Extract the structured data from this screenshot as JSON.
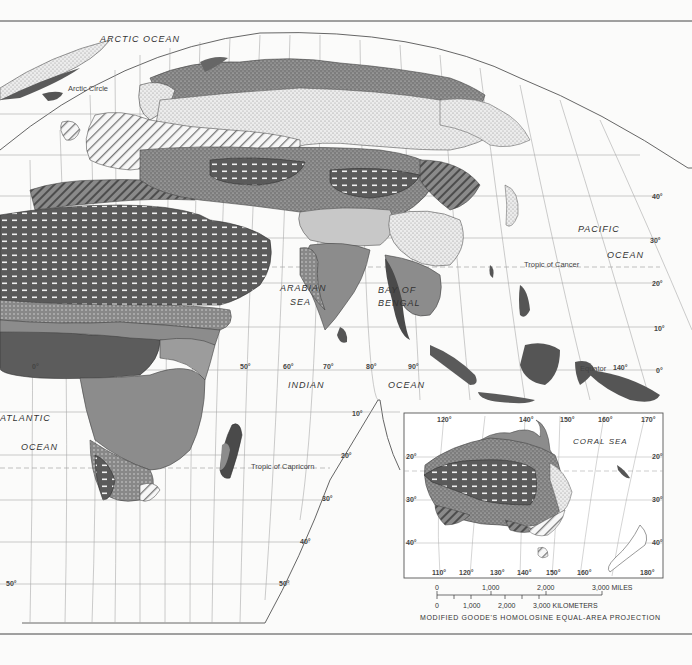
{
  "map": {
    "projection": "MODIFIED GOODE'S HOMOLOSINE EQUAL-AREA PROJECTION",
    "bodies_of_water": {
      "arctic": "ARCTIC OCEAN",
      "pacific_1": "PACIFIC",
      "pacific_2": "OCEAN",
      "arabian_1": "ARABIAN",
      "arabian_2": "SEA",
      "bengal_1": "BAY OF",
      "bengal_2": "BENGAL",
      "indian_1": "INDIAN",
      "indian_2": "OCEAN",
      "atlantic_1": "ATLANTIC",
      "atlantic_2": "OCEAN",
      "coral": "CORAL SEA"
    },
    "lines": {
      "arctic_circle": "Arctic Circle",
      "tropic_cancer": "Tropic of Cancer",
      "tropic_capricorn": "Tropic of Capricorn",
      "equator": "Equator"
    },
    "latitudes": {
      "n40": "40°",
      "n30": "30°",
      "n20": "20°",
      "n10": "10°",
      "eq": "0°",
      "s10": "10°",
      "s20": "20°",
      "s30": "30°",
      "s40": "40°",
      "s50a": "50°",
      "s50b": "50°"
    },
    "longitudes": {
      "l0": "0°",
      "l50": "50°",
      "l60": "60°",
      "l70": "70°",
      "l80": "80°",
      "l90": "90°",
      "l140": "140°"
    },
    "inset": {
      "top": [
        "120°",
        "140°",
        "150°",
        "160°",
        "170°"
      ],
      "bottom": [
        "110°",
        "120°",
        "130°",
        "140°",
        "150°",
        "160°",
        "180°"
      ],
      "left": [
        "20°",
        "30°",
        "40°"
      ],
      "right": [
        "20°",
        "30°",
        "40°"
      ]
    },
    "scale": {
      "miles": [
        "0",
        "1,000",
        "2,000",
        "3,000 MILES"
      ],
      "km": [
        "0",
        "1,000",
        "2,000",
        "3,000 KILOMETERS"
      ]
    }
  },
  "colors": {
    "background": "#fbfbfa",
    "ocean": "#ffffff",
    "grid": "#9a9a9a",
    "dark": "#4a4a4a",
    "medium": "#8c8c8c",
    "light": "#bdbdbd",
    "speckle": "#7a7a7a",
    "dots": "#e4e4e4"
  }
}
